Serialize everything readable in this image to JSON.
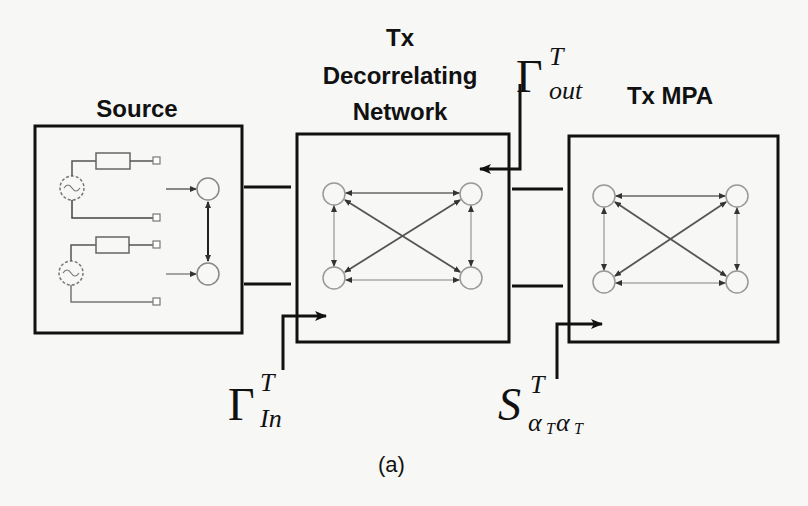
{
  "figure": {
    "caption": "(a)",
    "blocks": [
      {
        "id": "source",
        "title": "Source"
      },
      {
        "id": "decorrelating",
        "title_lines": [
          "Tx",
          "Decorrelating",
          "Network"
        ]
      },
      {
        "id": "mpa",
        "title": "Tx MPA"
      }
    ],
    "labels": {
      "gamma_out": {
        "base": "Γ",
        "sup": "T",
        "sub": "out"
      },
      "gamma_in": {
        "base": "Γ",
        "sup": "T",
        "sub": "In"
      },
      "s_param": {
        "base": "S",
        "sup": "T",
        "sub": "α",
        "sub2": "T",
        "sub3": "α",
        "sub4": "T"
      }
    },
    "colors": {
      "line": "#111111",
      "light_line": "#888888",
      "background": "#f7f7f5"
    }
  }
}
